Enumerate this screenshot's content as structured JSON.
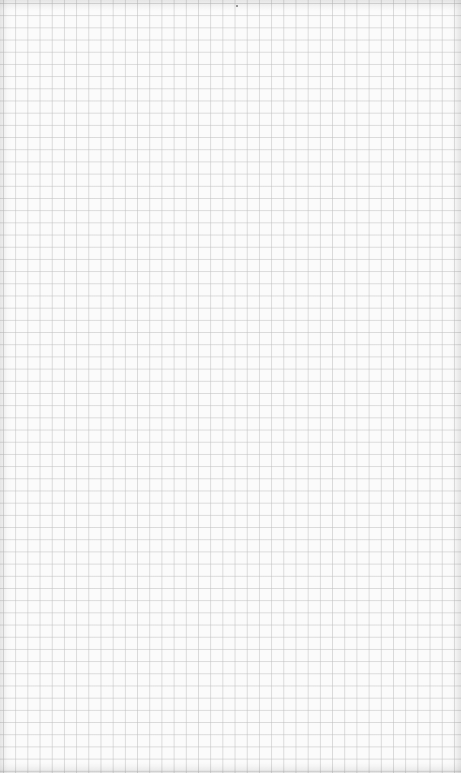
{
  "image": {
    "subject": "blank graph paper sheet",
    "grid": {
      "cell_size_px": 12.2,
      "line_color": "#bebebe",
      "background_color": "#fbfbfb"
    },
    "text_content": []
  }
}
